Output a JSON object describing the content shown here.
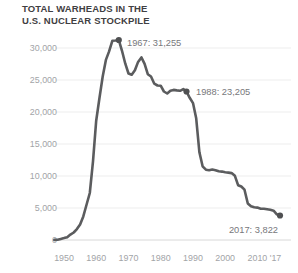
{
  "title": {
    "line1": "TOTAL WARHEADS IN THE",
    "line2": "U.S. NUCLEAR STOCKPILE"
  },
  "colors": {
    "background": "#ffffff",
    "title_text": "#3f4042",
    "line": "#5b5c5e",
    "marker": "#4f5052",
    "annotation_text": "#77787b",
    "axis_text": "#a2a4a7",
    "gridline": "#ededed",
    "baseline": "#d8d8d8"
  },
  "chart_data": {
    "type": "line",
    "title": "TOTAL WARHEADS IN THE U.S. NUCLEAR STOCKPILE",
    "xlabel": "",
    "ylabel": "",
    "grid": "horizontal",
    "legend": "none",
    "xlim": [
      1945,
      2019
    ],
    "ylim": [
      0,
      30000
    ],
    "x_ticks": [
      1950,
      1960,
      1970,
      1980,
      1990,
      2000,
      2010,
      2017
    ],
    "x_tick_labels": [
      "1950",
      "1960",
      "1970",
      "1980",
      "1990",
      "2000",
      "2010",
      "'17"
    ],
    "y_ticks": [
      0,
      5000,
      10000,
      15000,
      20000,
      25000,
      30000
    ],
    "y_tick_labels": [
      "0",
      "5,000",
      "10,000",
      "15,000",
      "20,000",
      "25,000",
      "30,000"
    ],
    "series": [
      {
        "name": "Total warheads in the U.S. nuclear stockpile",
        "points": [
          [
            1947,
            13
          ],
          [
            1948,
            50
          ],
          [
            1949,
            170
          ],
          [
            1950,
            299
          ],
          [
            1951,
            438
          ],
          [
            1952,
            841
          ],
          [
            1953,
            1169
          ],
          [
            1954,
            1703
          ],
          [
            1955,
            2422
          ],
          [
            1956,
            3692
          ],
          [
            1957,
            5543
          ],
          [
            1958,
            7345
          ],
          [
            1959,
            12298
          ],
          [
            1960,
            18638
          ],
          [
            1961,
            22229
          ],
          [
            1962,
            25540
          ],
          [
            1963,
            28133
          ],
          [
            1964,
            29463
          ],
          [
            1965,
            31139
          ],
          [
            1966,
            31175
          ],
          [
            1967,
            31255
          ],
          [
            1968,
            29561
          ],
          [
            1969,
            27552
          ],
          [
            1970,
            26008
          ],
          [
            1971,
            25830
          ],
          [
            1972,
            26516
          ],
          [
            1973,
            27835
          ],
          [
            1974,
            28537
          ],
          [
            1975,
            27519
          ],
          [
            1976,
            25914
          ],
          [
            1977,
            25542
          ],
          [
            1978,
            24418
          ],
          [
            1979,
            24138
          ],
          [
            1980,
            24104
          ],
          [
            1981,
            23208
          ],
          [
            1982,
            22886
          ],
          [
            1983,
            23305
          ],
          [
            1984,
            23459
          ],
          [
            1985,
            23368
          ],
          [
            1986,
            23317
          ],
          [
            1987,
            23575
          ],
          [
            1988,
            23205
          ],
          [
            1989,
            22217
          ],
          [
            1990,
            21392
          ],
          [
            1991,
            19008
          ],
          [
            1992,
            13708
          ],
          [
            1993,
            11511
          ],
          [
            1994,
            10979
          ],
          [
            1995,
            10904
          ],
          [
            1996,
            11011
          ],
          [
            1997,
            10903
          ],
          [
            1998,
            10732
          ],
          [
            1999,
            10685
          ],
          [
            2000,
            10577
          ],
          [
            2001,
            10526
          ],
          [
            2002,
            10457
          ],
          [
            2003,
            10027
          ],
          [
            2004,
            8570
          ],
          [
            2005,
            8360
          ],
          [
            2006,
            7853
          ],
          [
            2007,
            5709
          ],
          [
            2008,
            5273
          ],
          [
            2009,
            5113
          ],
          [
            2010,
            5066
          ],
          [
            2011,
            4897
          ],
          [
            2012,
            4881
          ],
          [
            2013,
            4804
          ],
          [
            2014,
            4717
          ],
          [
            2015,
            4571
          ],
          [
            2016,
            4018
          ],
          [
            2017,
            3822
          ]
        ]
      }
    ],
    "annotations": [
      {
        "year": 1967,
        "value": 31255,
        "label": "1967: 31,255"
      },
      {
        "year": 1988,
        "value": 23205,
        "label": "1988: 23,205"
      },
      {
        "year": 2017,
        "value": 3822,
        "label": "2017: 3,822"
      }
    ]
  }
}
